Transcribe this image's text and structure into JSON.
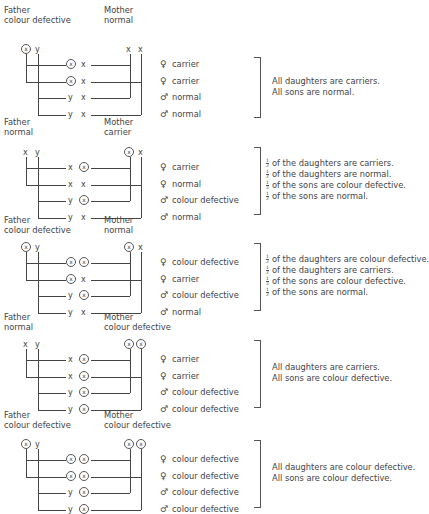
{
  "symbols": {
    "female": "♀",
    "male": "♂",
    "normal_x": "x",
    "y": "y",
    "affected_x": "x"
  },
  "crosses": [
    {
      "father": {
        "title": "Father",
        "status": "colour defective",
        "chromosomes": [
          "X*",
          "y"
        ]
      },
      "mother": {
        "title": "Mother",
        "status": "normal",
        "chromosomes": [
          "x",
          "x"
        ]
      },
      "offspring": [
        {
          "sex": "female",
          "from_father": "X*",
          "from_mother": "x",
          "result": "carrier"
        },
        {
          "sex": "female",
          "from_father": "X*",
          "from_mother": "x",
          "result": "carrier"
        },
        {
          "sex": "male",
          "from_father": "y",
          "from_mother": "x",
          "result": "normal"
        },
        {
          "sex": "male",
          "from_father": "y",
          "from_mother": "x",
          "result": "normal"
        }
      ],
      "summary": [
        {
          "fraction": "",
          "text": "All daughters are carriers."
        },
        {
          "fraction": "",
          "text": "All sons are normal."
        }
      ]
    },
    {
      "father": {
        "title": "Father",
        "status": "normal",
        "chromosomes": [
          "x",
          "y"
        ]
      },
      "mother": {
        "title": "Mother",
        "status": "carrier",
        "chromosomes": [
          "X*",
          "x"
        ]
      },
      "offspring": [
        {
          "sex": "female",
          "from_father": "x",
          "from_mother": "X*",
          "result": "carrier"
        },
        {
          "sex": "female",
          "from_father": "x",
          "from_mother": "x",
          "result": "normal"
        },
        {
          "sex": "male",
          "from_father": "y",
          "from_mother": "X*",
          "result": "colour defective"
        },
        {
          "sex": "male",
          "from_father": "y",
          "from_mother": "x",
          "result": "normal"
        }
      ],
      "summary": [
        {
          "fraction": "1/2",
          "text": "of the daughters are carriers."
        },
        {
          "fraction": "1/2",
          "text": "of the daughters are normal."
        },
        {
          "fraction": "1/2",
          "text": "of the sons are colour defective."
        },
        {
          "fraction": "1/2",
          "text": "of the sons are normal."
        }
      ]
    },
    {
      "father": {
        "title": "Father",
        "status": "colour defective",
        "chromosomes": [
          "X*",
          "y"
        ]
      },
      "mother": {
        "title": "Mother",
        "status": "normal",
        "chromosomes": [
          "X*",
          "x"
        ]
      },
      "offspring": [
        {
          "sex": "female",
          "from_father": "X*",
          "from_mother": "X*",
          "result": "colour defective"
        },
        {
          "sex": "female",
          "from_father": "X*",
          "from_mother": "x",
          "result": "carrier"
        },
        {
          "sex": "male",
          "from_father": "y",
          "from_mother": "X*",
          "result": "colour defective"
        },
        {
          "sex": "male",
          "from_father": "y",
          "from_mother": "x",
          "result": "normal"
        }
      ],
      "summary": [
        {
          "fraction": "1/2",
          "text": "of the daughters are colour defective."
        },
        {
          "fraction": "1/2",
          "text": "of the daughters are carriers."
        },
        {
          "fraction": "1/2",
          "text": "of the sons are colour defective."
        },
        {
          "fraction": "1/2",
          "text": "of the sons are normal."
        }
      ]
    },
    {
      "father": {
        "title": "Father",
        "status": "normal",
        "chromosomes": [
          "x",
          "y"
        ]
      },
      "mother": {
        "title": "Mother",
        "status": "colour defective",
        "chromosomes": [
          "X*",
          "X*"
        ]
      },
      "offspring": [
        {
          "sex": "female",
          "from_father": "x",
          "from_mother": "X*",
          "result": "carrier"
        },
        {
          "sex": "female",
          "from_father": "x",
          "from_mother": "X*",
          "result": "carrier"
        },
        {
          "sex": "male",
          "from_father": "y",
          "from_mother": "X*",
          "result": "colour defective"
        },
        {
          "sex": "male",
          "from_father": "y",
          "from_mother": "X*",
          "result": "colour defective"
        }
      ],
      "summary": [
        {
          "fraction": "",
          "text": "All daughters are carriers."
        },
        {
          "fraction": "",
          "text": "All sons are colour defective."
        }
      ]
    },
    {
      "father": {
        "title": "Father",
        "status": "colour defective",
        "chromosomes": [
          "X*",
          "y"
        ]
      },
      "mother": {
        "title": "Mother",
        "status": "colour defective",
        "chromosomes": [
          "X*",
          "X*"
        ]
      },
      "offspring": [
        {
          "sex": "female",
          "from_father": "X*",
          "from_mother": "X*",
          "result": "colour defective"
        },
        {
          "sex": "female",
          "from_father": "X*",
          "from_mother": "X*",
          "result": "colour defective"
        },
        {
          "sex": "male",
          "from_father": "y",
          "from_mother": "X*",
          "result": "colour defective"
        },
        {
          "sex": "male",
          "from_father": "y",
          "from_mother": "X*",
          "result": "colour defective"
        }
      ],
      "summary": [
        {
          "fraction": "",
          "text": "All daughters are colour defective."
        },
        {
          "fraction": "",
          "text": "All sons are colour defective."
        }
      ]
    }
  ]
}
